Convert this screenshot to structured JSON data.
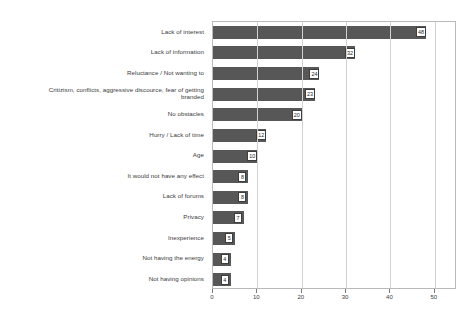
{
  "chart_data": {
    "type": "bar",
    "orientation": "horizontal",
    "title": "",
    "subtitle": "",
    "xlabel": "",
    "ylabel": "",
    "xlim": [
      0,
      55
    ],
    "ylim": null,
    "grid": "vertical",
    "legend": "none",
    "bar_color": "#575757",
    "frame_color": "#b9b9b9",
    "gridline_color": "#d2d2d2",
    "xticks": [
      0,
      10,
      20,
      30,
      40,
      50
    ],
    "xtick_labels": [
      "0",
      "10",
      "20",
      "30",
      "40",
      "50"
    ],
    "categories": [
      "Lack of interest",
      "Lack of information",
      "Reluctance / Not wanting to",
      "Critizism, conflicts, aggressive discource, fear of getting\nbranded",
      "No obstacles",
      "Hurry / Lack of time",
      "Age",
      "It would not have any effect",
      "Lack of forums",
      "Privacy",
      "Inexperience",
      "Not having the energy",
      "Not having opinions"
    ],
    "values": [
      48,
      32,
      24,
      23,
      20,
      12,
      10,
      8,
      8,
      7,
      5,
      4,
      4
    ],
    "value_labels": [
      "48",
      "32",
      "24",
      "23",
      "20",
      "12",
      "10",
      "8",
      "8",
      "7",
      "5",
      "4",
      "4"
    ]
  }
}
